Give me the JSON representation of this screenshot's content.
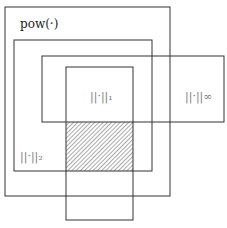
{
  "diagram": {
    "colors": {
      "stroke": "#333333",
      "hatch": "#555555",
      "background": "#ffffff"
    },
    "regions": [
      {
        "id": "pow",
        "label": "pow(·)",
        "x": 5,
        "y": 7,
        "w": 165,
        "h": 189
      },
      {
        "id": "l2",
        "label": "||·||₂",
        "x": 14,
        "y": 40,
        "w": 138,
        "h": 131
      },
      {
        "id": "linf",
        "label": "||·||∞",
        "x": 42,
        "y": 56,
        "w": 182,
        "h": 66
      },
      {
        "id": "l1",
        "label": "||·||₁",
        "x": 66,
        "y": 67,
        "w": 67,
        "h": 153
      }
    ],
    "hatched_region": {
      "x": 66,
      "y": 122,
      "w": 67,
      "h": 49
    },
    "labels": {
      "pow": "pow(·)",
      "l1": "||·||₁",
      "l2": "||·||₂",
      "linf": "||·||∞"
    }
  }
}
